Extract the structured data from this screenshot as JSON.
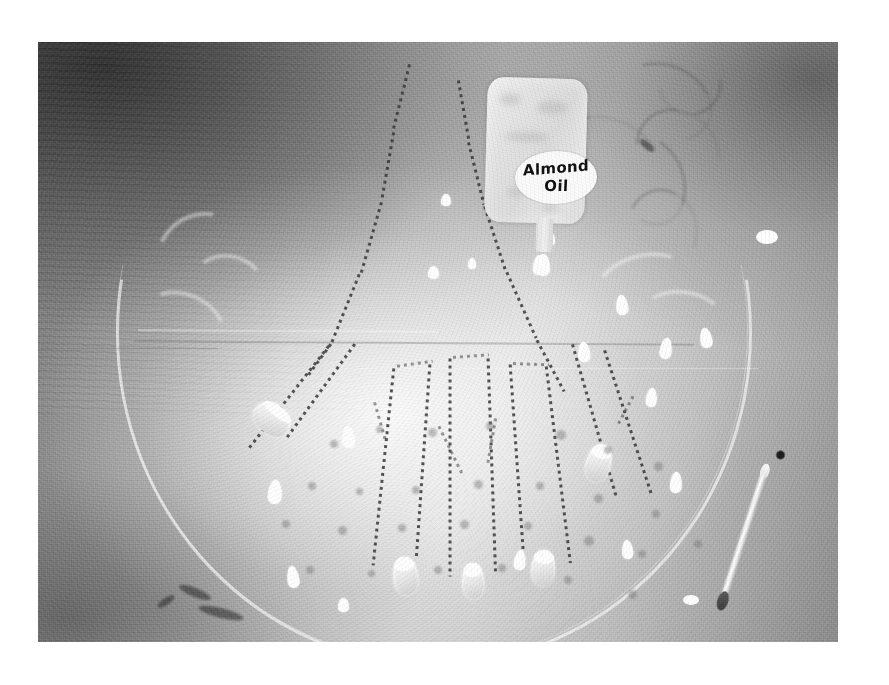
{
  "scene": {
    "title": "Almond Oil Hand",
    "medium": "grainy black-and-white photographic print with white border",
    "palette": {
      "print_border": "#ffffff",
      "photo_light": "#e8e8e8",
      "photo_mid": "#b4b4b4",
      "photo_dark": "#555555",
      "ink": "#373737",
      "highlight": "#ffffff"
    }
  },
  "bottle": {
    "name": "almond-oil-bottle",
    "label_line_1": "Almond",
    "label_line_2": "Oil",
    "label_shape": "oval",
    "body_shape": "rounded-rectangle",
    "nozzle": "spout",
    "dripping": true
  },
  "hand": {
    "name": "dotted-hand-outline",
    "style": "dotted stipple line drawing",
    "fingers": 5,
    "nail_count": 5,
    "palm_freckles": 26,
    "orientation": "fingers pointing down"
  },
  "objects": [
    {
      "name": "oil-droplet",
      "count": 11,
      "color": "#ffffff",
      "shape": "teardrop"
    },
    {
      "name": "cotton-swab",
      "count": 1,
      "tip_color": "#3a3a3a"
    },
    {
      "name": "faint-circle-arc",
      "count": 1
    },
    {
      "name": "crescent-leaf-shape",
      "count": 4
    },
    {
      "name": "swirl-scribble",
      "count": 5
    },
    {
      "name": "horizontal-rule",
      "count": 4
    },
    {
      "name": "dark-smudge",
      "count": 4
    }
  ],
  "geometry": {
    "canvas_width": 889,
    "canvas_height": 685,
    "photo_left": 38,
    "photo_top": 42,
    "photo_width": 800,
    "photo_height": 600
  }
}
